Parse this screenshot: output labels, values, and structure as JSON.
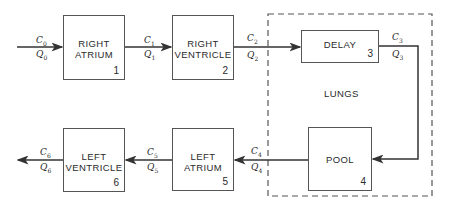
{
  "diagram": {
    "blocks": [
      {
        "id": "right-atrium",
        "line1": "RIGHT",
        "line2": "ATRIUM",
        "number": "1"
      },
      {
        "id": "right-ventricle",
        "line1": "RIGHT",
        "line2": "VENTRICLE",
        "number": "2"
      },
      {
        "id": "delay",
        "line1": "DELAY",
        "line2": "",
        "number": "3"
      },
      {
        "id": "pool",
        "line1": "POOL",
        "line2": "",
        "number": "4"
      },
      {
        "id": "left-atrium",
        "line1": "LEFT",
        "line2": "ATRIUM",
        "number": "5"
      },
      {
        "id": "left-ventricle",
        "line1": "LEFT",
        "line2": "VENTRICLE",
        "number": "6"
      }
    ],
    "group_label": "LUNGS",
    "flows": [
      {
        "c": "C",
        "q": "Q",
        "sub": "0"
      },
      {
        "c": "C",
        "q": "Q",
        "sub": "1"
      },
      {
        "c": "C",
        "q": "Q",
        "sub": "2"
      },
      {
        "c": "C",
        "q": "Q",
        "sub": "3"
      },
      {
        "c": "C",
        "q": "Q",
        "sub": "4"
      },
      {
        "c": "C",
        "q": "Q",
        "sub": "5"
      },
      {
        "c": "C",
        "q": "Q",
        "sub": "6"
      }
    ]
  }
}
